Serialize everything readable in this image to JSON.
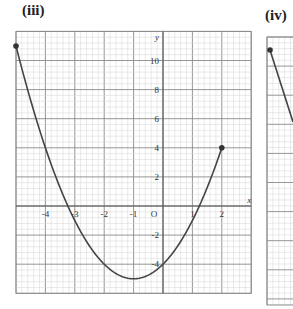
{
  "panels": [
    {
      "label": "(iii)"
    },
    {
      "label": "(iv)"
    }
  ],
  "chart_data": [
    {
      "type": "line",
      "title": "(iii)",
      "function": "y = x^2 + 2x - 4",
      "x": [
        -5,
        -4,
        -3,
        -2,
        -1,
        0,
        1,
        2
      ],
      "y": [
        11,
        4,
        -1,
        -4,
        -5,
        -4,
        -1,
        4
      ],
      "endpoints": [
        [
          -5,
          11
        ],
        [
          2,
          4
        ]
      ],
      "xlabel": "x",
      "ylabel": "y",
      "xlim": [
        -5,
        3
      ],
      "ylim": [
        -6,
        12
      ],
      "x_ticks": [
        "-4",
        "-3",
        "-2",
        "-1",
        "O",
        "1",
        "2"
      ],
      "y_ticks": [
        "10",
        "8",
        "6",
        "4",
        "2",
        "-2",
        "-4"
      ],
      "grid": true
    },
    {
      "type": "line",
      "title": "(iv)",
      "note": "partially visible, cropped at right edge",
      "grid": true
    }
  ]
}
